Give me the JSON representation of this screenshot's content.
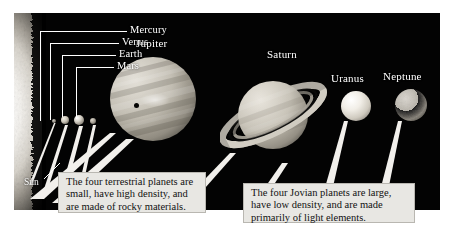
{
  "figure": {
    "background_color": "#ffffff",
    "plate_color": "#030303"
  },
  "labels": {
    "mercury": "Mercury",
    "venus": "Venus",
    "earth": "Earth",
    "mars": "Mars",
    "jupiter": "Jupiter",
    "saturn": "Saturn",
    "uranus": "Uranus",
    "neptune": "Neptune",
    "sun": "Sun"
  },
  "captions": {
    "terrestrial": "The four terrestrial planets are small, have high density, and are made of rocky materials.",
    "jovian": "The four Jovian planets are large, have low density, and are made primarily of light elements."
  },
  "bodies": [
    {
      "name": "Sun",
      "label": "Sun",
      "group": "star",
      "rendered": "bright limb at far left edge"
    },
    {
      "name": "Mercury",
      "label": "Mercury",
      "group": "terrestrial",
      "relative_size": "smallest"
    },
    {
      "name": "Venus",
      "label": "Venus",
      "group": "terrestrial",
      "relative_size": "small"
    },
    {
      "name": "Earth",
      "label": "Earth",
      "group": "terrestrial",
      "relative_size": "small"
    },
    {
      "name": "Mars",
      "label": "Mars",
      "group": "terrestrial",
      "relative_size": "smallest"
    },
    {
      "name": "Jupiter",
      "label": "Jupiter",
      "group": "jovian",
      "relative_size": "largest",
      "features": "banded cloud belts, dark moon shadow"
    },
    {
      "name": "Saturn",
      "label": "Saturn",
      "group": "jovian",
      "relative_size": "large",
      "features": "tilted ring system"
    },
    {
      "name": "Uranus",
      "label": "Uranus",
      "group": "jovian",
      "relative_size": "medium",
      "features": "smooth bright disk"
    },
    {
      "name": "Neptune",
      "label": "Neptune",
      "group": "jovian",
      "relative_size": "medium",
      "features": "mottled darker disk"
    }
  ],
  "colors": {
    "plate": "#030303",
    "label_text": "#ffffff",
    "caption_background": "#e8e7e3",
    "caption_border": "#b9b7b1",
    "caption_text": "#111111",
    "leader_line": "#ffffff",
    "wedge": "#f2f0ec"
  }
}
